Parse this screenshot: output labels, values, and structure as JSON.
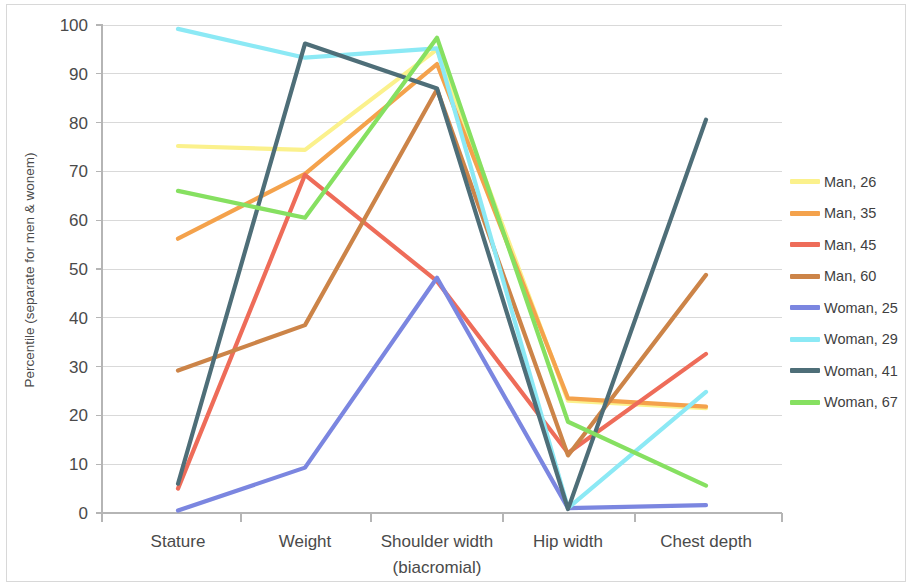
{
  "chart_data": {
    "type": "line",
    "title": "",
    "xlabel": "",
    "ylabel": "Percentile (separate for men & wonem)",
    "categories": [
      "Stature",
      "Weight",
      "Shoulder width\n(biacromial)",
      "Hip width",
      "Chest depth"
    ],
    "category_labels": [
      {
        "line1": "Stature",
        "line2": ""
      },
      {
        "line1": "Weight",
        "line2": ""
      },
      {
        "line1": "Shoulder width",
        "line2": "(biacromial)"
      },
      {
        "line1": "Hip width",
        "line2": ""
      },
      {
        "line1": "Chest depth",
        "line2": ""
      }
    ],
    "ylim": [
      0,
      100
    ],
    "yticks": [
      0,
      10,
      20,
      30,
      40,
      50,
      60,
      70,
      80,
      90,
      100
    ],
    "ytick_labels": [
      "0",
      "10",
      "20",
      "30",
      "40",
      "50",
      "60",
      "70",
      "80",
      "90",
      "100"
    ],
    "grid": true,
    "legend_position": "right",
    "series": [
      {
        "name": "Man, 26",
        "color": "#FBF18C",
        "values": [
          75.2,
          74.4,
          95.0,
          23.0,
          21.5
        ]
      },
      {
        "name": "Man, 35",
        "color": "#F4A24C",
        "values": [
          56.2,
          69.5,
          92.0,
          23.5,
          21.8
        ]
      },
      {
        "name": "Man, 45",
        "color": "#EE6C59",
        "values": [
          5.0,
          69.3,
          47.5,
          12.3,
          32.6
        ]
      },
      {
        "name": "Man, 60",
        "color": "#CC8448",
        "values": [
          29.2,
          38.5,
          86.8,
          11.8,
          48.8
        ]
      },
      {
        "name": "Woman, 25",
        "color": "#7B86E0",
        "values": [
          0.5,
          9.3,
          48.2,
          1.0,
          1.6
        ]
      },
      {
        "name": "Woman, 29",
        "color": "#8CE9F5",
        "values": [
          99.2,
          93.3,
          95.2,
          1.0,
          24.8
        ]
      },
      {
        "name": "Woman, 41",
        "color": "#4E6E78",
        "values": [
          6.0,
          96.2,
          87.0,
          0.8,
          80.6
        ]
      },
      {
        "name": "Woman, 67",
        "color": "#86E061",
        "values": [
          66.0,
          60.5,
          97.4,
          18.7,
          5.6
        ]
      }
    ]
  },
  "legend": {
    "items": [
      {
        "label": "Man, 26",
        "color": "#FBF18C"
      },
      {
        "label": "Man, 35",
        "color": "#F4A24C"
      },
      {
        "label": "Man, 45",
        "color": "#EE6C59"
      },
      {
        "label": "Man, 60",
        "color": "#CC8448"
      },
      {
        "label": "Woman, 25",
        "color": "#7B86E0"
      },
      {
        "label": "Woman, 29",
        "color": "#8CE9F5"
      },
      {
        "label": "Woman, 41",
        "color": "#4E6E78"
      },
      {
        "label": "Woman, 67",
        "color": "#86E061"
      }
    ]
  }
}
